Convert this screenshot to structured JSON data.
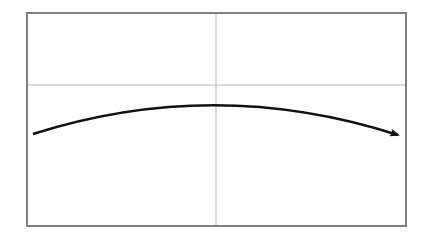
{
  "diagram": {
    "frame": {
      "x": 27,
      "y": 13,
      "width": 379,
      "height": 213,
      "stroke": "#808080",
      "stroke_width": 2
    },
    "crosshair": {
      "vertical_x": 216,
      "horizontal_y": 85,
      "stroke": "#b0b0b0"
    },
    "curve": {
      "start": [
        33,
        134
      ],
      "control": [
        215,
        76
      ],
      "end": [
        396,
        135
      ],
      "stroke": "#111111",
      "stroke_width": 2.5,
      "arrowhead": "end"
    }
  }
}
